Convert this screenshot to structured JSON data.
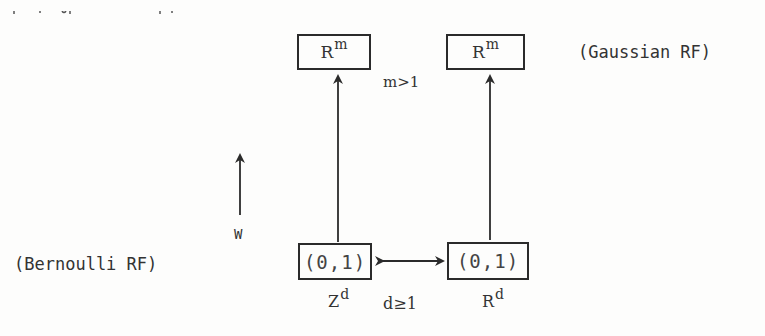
{
  "diagram": {
    "top_left_box": {
      "base": "R",
      "sup": "m"
    },
    "top_right_box": {
      "base": "R",
      "sup": "m"
    },
    "bottom_left_box": {
      "text": "(0,1)"
    },
    "bottom_right_box": {
      "text": "(0,1)"
    },
    "m_condition": "m>1",
    "d_condition": "d≥1",
    "left_domain": {
      "base": "Z",
      "sup": "d"
    },
    "right_domain": {
      "base": "R",
      "sup": "d"
    },
    "gaussian_label": "(Gaussian RF)",
    "bernoulli_label": "(Bernoulli RF)",
    "side_arrow_label": "W",
    "arrows": [
      {
        "name": "map-arrow-left",
        "from": "bottom_left_box",
        "to": "top_left_box",
        "direction": "up"
      },
      {
        "name": "map-arrow-right",
        "from": "bottom_right_box",
        "to": "top_right_box",
        "direction": "up"
      },
      {
        "name": "correspondence-arrow",
        "from": "bottom_left_box",
        "to": "bottom_right_box",
        "direction": "both"
      },
      {
        "name": "w-direction-arrow",
        "direction": "up"
      }
    ],
    "colors": {
      "ink": "#2b2b2b",
      "paper": "#fdfdfc"
    }
  }
}
